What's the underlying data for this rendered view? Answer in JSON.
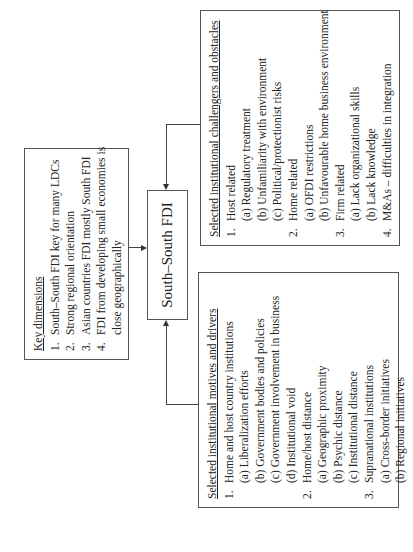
{
  "orientation": "rotated-90-counterclockwise",
  "center": {
    "label": "South–South FDI"
  },
  "key_dimensions": {
    "title": "Key dimensions",
    "items": [
      {
        "num": "1.",
        "text": "South–South FDI key for many LDCs"
      },
      {
        "num": "2.",
        "text": "Strong regional orientation"
      },
      {
        "num": "3.",
        "text": "Asian countries FDI mostly South FDI"
      },
      {
        "num": "4.",
        "text": "FDI from developing small economies is",
        "cont": "close geographically"
      }
    ]
  },
  "challenges": {
    "title": "Selected institutional challengers and obstacles",
    "rows": [
      {
        "num": "1.",
        "text": "Host related"
      },
      {
        "sub": "(a) Regulatory treatment"
      },
      {
        "sub": "(b) Unfamiliarity with environment"
      },
      {
        "sub": "(c) Political/protectionist risks"
      },
      {
        "num": "2.",
        "text": "Home related"
      },
      {
        "sub": "(a) OFDI restrictions"
      },
      {
        "sub": "(b) Unfavourable home business environment"
      },
      {
        "num": "3.",
        "text": "Firm related"
      },
      {
        "sub": "(a) Lack organizational skills"
      },
      {
        "sub": "(b) Lack knowledge"
      },
      {
        "num": "4.",
        "text": "M&As – difficulties in integration"
      }
    ]
  },
  "motives": {
    "title": "Selected institutional motives and drivers",
    "rows": [
      {
        "num": "1.",
        "text": "Home and host country institutions"
      },
      {
        "sub": "(a) Liberalization efforts"
      },
      {
        "sub": "(b) Government bodies and policies"
      },
      {
        "sub": "(c) Government involvement in business"
      },
      {
        "sub": "(d) Institutional void"
      },
      {
        "num": "2.",
        "text": "Home/host distance"
      },
      {
        "sub": "(a) Geographic proximity"
      },
      {
        "sub": "(b) Psychic distance"
      },
      {
        "sub": "(c) Institutional distance"
      },
      {
        "num": "3.",
        "text": "Supranational institutions"
      },
      {
        "sub": "(a) Cross-border initiatives"
      },
      {
        "sub": "(b) Regional initiatives"
      }
    ]
  }
}
